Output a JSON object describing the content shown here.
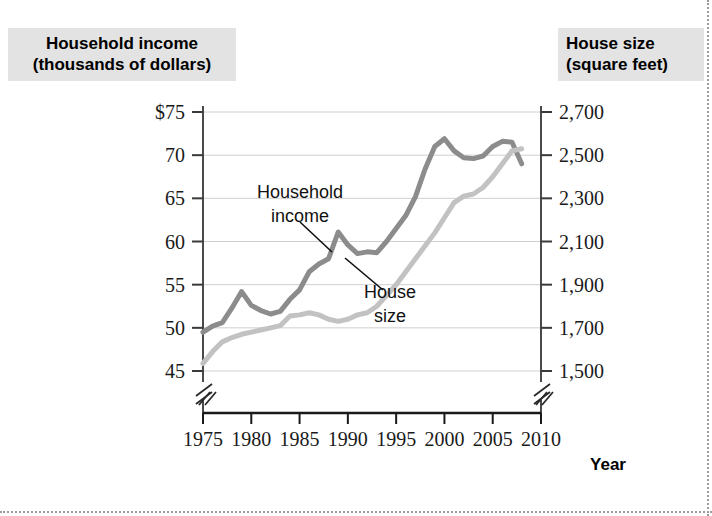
{
  "figure": {
    "background_color": "#ffffff",
    "label_background_color": "#e3e3e3"
  },
  "left_axis_title": "Household income\n(thousands of dollars)",
  "right_axis_title": "House size\n(square feet)",
  "x_axis_name": "Year",
  "annotations": [
    {
      "name": "household-income",
      "line1": "Household",
      "line2": "income"
    },
    {
      "name": "house-size",
      "line1": "House",
      "line2": "size"
    }
  ],
  "chart_data": {
    "type": "line",
    "title": "",
    "subtitle": "",
    "xlabel": "Year",
    "ylabel": "Household income (thousands of dollars)",
    "y2label": "House size (square feet)",
    "xlim": [
      1975,
      2010
    ],
    "ylim": [
      45,
      75
    ],
    "y2lim": [
      1500,
      2700
    ],
    "xticks": [
      1975,
      1980,
      1985,
      1990,
      1995,
      2000,
      2005,
      2010
    ],
    "xticklabels": [
      "1975",
      "1980",
      "1985",
      "1990",
      "1995",
      "2000",
      "2005",
      "2010"
    ],
    "yticks": [
      45,
      50,
      55,
      60,
      65,
      70,
      75
    ],
    "yticklabels": [
      "45",
      "50",
      "55",
      "60",
      "65",
      "70",
      "$75"
    ],
    "y2ticks": [
      1500,
      1700,
      1900,
      2100,
      2300,
      2500,
      2700
    ],
    "y2ticklabels": [
      "1,500",
      "1,700",
      "1,900",
      "2,100",
      "2,300",
      "2,500",
      "2,700"
    ],
    "grid": true,
    "grid_axis": "y",
    "axis_break_x": true,
    "axis_break_y": true,
    "legend": "annotations-inline",
    "legend_position": "inline-callouts",
    "x": [
      1975,
      1976,
      1977,
      1978,
      1979,
      1980,
      1981,
      1982,
      1983,
      1984,
      1985,
      1986,
      1987,
      1988,
      1989,
      1990,
      1991,
      1992,
      1993,
      1994,
      1995,
      1996,
      1997,
      1998,
      1999,
      2000,
      2001,
      2002,
      2003,
      2004,
      2005,
      2006,
      2007,
      2008
    ],
    "series": [
      {
        "name": "Household income",
        "color": "#8c8c8c",
        "axis": "left",
        "unit": "thousands of dollars",
        "values": [
          49.5,
          50.2,
          50.6,
          52.3,
          54.2,
          52.6,
          52.0,
          51.6,
          51.9,
          53.3,
          54.4,
          56.5,
          57.4,
          58.0,
          61.1,
          59.6,
          58.6,
          58.8,
          58.7,
          60.0,
          61.5,
          63.0,
          65.2,
          68.4,
          71.0,
          71.9,
          70.5,
          69.7,
          69.6,
          69.9,
          71.0,
          71.6,
          71.5,
          69.0
        ]
      },
      {
        "name": "House size",
        "color": "#c2c2c2",
        "axis": "right",
        "unit": "square feet",
        "values": [
          1535,
          1590,
          1635,
          1655,
          1670,
          1680,
          1690,
          1700,
          1710,
          1755,
          1760,
          1770,
          1760,
          1740,
          1730,
          1740,
          1760,
          1770,
          1800,
          1850,
          1900,
          1960,
          2020,
          2080,
          2140,
          2210,
          2280,
          2310,
          2320,
          2350,
          2400,
          2460,
          2520,
          2530
        ]
      }
    ]
  },
  "geometry": {
    "plot_left": 203,
    "plot_right": 541,
    "plot_top": 112,
    "plot_bottom": 371,
    "x_axis_y": 413,
    "x_pixel_start": 203,
    "x_pixel_end": 541
  }
}
